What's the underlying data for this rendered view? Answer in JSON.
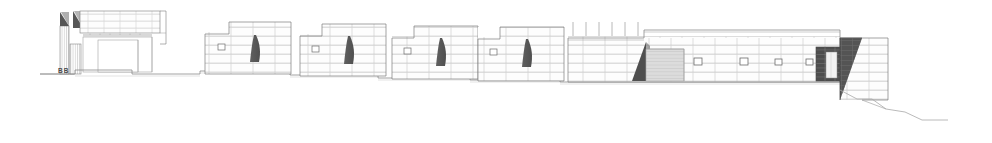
{
  "drawing": {
    "type": "architectural-elevation",
    "title": "",
    "section_label": "BB",
    "scale_note": "",
    "canvas": {
      "width": 992,
      "height": 143
    },
    "colors": {
      "background": "#ffffff",
      "line": "#6b6b6b",
      "line_strong": "#4a4a4a",
      "mortar": "#b9b9b9",
      "stone_fill": "#fdfdfd",
      "shadow_wedge": "#5a5a5a",
      "shadow_wedge_dark": "#4d4d4d",
      "dark_hatch": "#4a4a4a",
      "gate_panel": "#d9d9d9",
      "gate_panel_line": "#bdbdbd",
      "ground_line": "#8a8a8a",
      "label_text": "#4a4a4a"
    },
    "ground": {
      "name": "stepped-ground-line",
      "left_start_x": 40,
      "right_end_x": 948,
      "steps": [
        {
          "x": 40,
          "y": 74
        },
        {
          "x": 75,
          "y": 74
        },
        {
          "x": 75,
          "y": 70
        },
        {
          "x": 132,
          "y": 70
        },
        {
          "x": 132,
          "y": 74
        },
        {
          "x": 200,
          "y": 74
        },
        {
          "x": 200,
          "y": 71
        },
        {
          "x": 290,
          "y": 71
        },
        {
          "x": 290,
          "y": 75
        },
        {
          "x": 378,
          "y": 75
        },
        {
          "x": 378,
          "y": 78
        },
        {
          "x": 470,
          "y": 78
        },
        {
          "x": 470,
          "y": 80
        },
        {
          "x": 560,
          "y": 80
        },
        {
          "x": 560,
          "y": 82
        },
        {
          "x": 840,
          "y": 82
        }
      ],
      "terrain_slope": [
        {
          "x": 840,
          "y": 90
        },
        {
          "x": 857,
          "y": 99
        },
        {
          "x": 872,
          "y": 99
        },
        {
          "x": 886,
          "y": 109
        },
        {
          "x": 905,
          "y": 112
        },
        {
          "x": 922,
          "y": 120
        },
        {
          "x": 948,
          "y": 120
        }
      ]
    },
    "structures": [
      {
        "id": "left-pavilion",
        "name": "Left pavilion with parapet",
        "x": 58,
        "y": 8,
        "width": 110,
        "height": 66,
        "features": [
          "parapet-masonry",
          "dark-wedge-shadow",
          "vertical-hatch-panel",
          "open-frame-bay",
          "glazed-opening"
        ]
      },
      {
        "id": "wall-segment-1",
        "name": "Boundary wall segment 1",
        "x": 205,
        "y": 22,
        "width": 86,
        "height": 52,
        "features": [
          "stepped-top",
          "dark-wedge-shadow",
          "square-opening"
        ]
      },
      {
        "id": "wall-segment-2",
        "name": "Boundary wall segment 2",
        "x": 300,
        "y": 24,
        "width": 86,
        "height": 52,
        "features": [
          "stepped-top",
          "dark-wedge-shadow",
          "square-opening"
        ]
      },
      {
        "id": "wall-segment-3",
        "name": "Boundary wall segment 3",
        "x": 392,
        "y": 26,
        "width": 86,
        "height": 53,
        "features": [
          "stepped-top",
          "dark-wedge-shadow",
          "square-opening"
        ]
      },
      {
        "id": "wall-segment-4",
        "name": "Boundary wall segment 4",
        "x": 478,
        "y": 27,
        "width": 86,
        "height": 54,
        "features": [
          "stepped-top",
          "dark-wedge-shadow",
          "square-opening"
        ]
      },
      {
        "id": "main-wall-gate-block",
        "name": "Main wall with gate and window band",
        "x": 568,
        "y": 21,
        "width": 272,
        "height": 61,
        "features": [
          "railing-posts",
          "dark-wedge-shadow",
          "gate-panel",
          "square-windows"
        ]
      },
      {
        "id": "right-tower",
        "name": "Right end tower",
        "x": 840,
        "y": 38,
        "width": 48,
        "height": 62,
        "features": [
          "diagonal-shadow-wedge",
          "stone-coursing"
        ]
      },
      {
        "id": "dark-recess",
        "name": "Dark recessed opening at tower base",
        "x": 816,
        "y": 47,
        "width": 28,
        "height": 34,
        "features": [
          "dark-hatch-fill",
          "light-panel"
        ]
      }
    ],
    "railing": {
      "name": "railing-posts",
      "count": 6,
      "top_y": 21,
      "base_y": 38,
      "x_positions": [
        573,
        586,
        599,
        612,
        625,
        638
      ]
    },
    "windows": [
      {
        "name": "window-1",
        "x": 694,
        "y": 58,
        "w": 8,
        "h": 7
      },
      {
        "name": "window-2",
        "x": 740,
        "y": 58,
        "w": 8,
        "h": 7
      },
      {
        "name": "window-3",
        "x": 775,
        "y": 59,
        "w": 7,
        "h": 6
      },
      {
        "name": "window-4",
        "x": 806,
        "y": 59,
        "w": 7,
        "h": 6
      }
    ],
    "gate": {
      "name": "main-gate",
      "x": 646,
      "y": 49,
      "width": 38,
      "height": 32,
      "panel_lines": 9
    }
  }
}
